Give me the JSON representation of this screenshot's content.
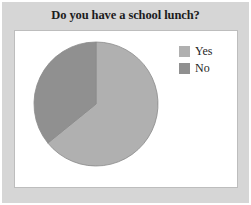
{
  "chart_data": {
    "type": "pie",
    "title": "Do you have a school lunch?",
    "xlabel": "",
    "ylabel": "",
    "categories": [
      "Yes",
      "No"
    ],
    "values": [
      64,
      36
    ],
    "units": "percent",
    "start_angle_deg": 0,
    "direction": "clockwise",
    "legend_position": "top-right",
    "grid": false,
    "slices": [
      {
        "label": "Yes",
        "value": 64,
        "sweep_deg": 231,
        "color": "#b0b0b0"
      },
      {
        "label": "No",
        "value": 36,
        "sweep_deg": 129,
        "color": "#909090"
      }
    ]
  },
  "legend": {
    "items": [
      {
        "label": "Yes",
        "color": "#b0b0b0"
      },
      {
        "label": "No",
        "color": "#909090"
      }
    ]
  },
  "colors": {
    "frame_background": "#d6d6d6",
    "plot_background": "#ffffff",
    "plot_border": "#bdbdbd",
    "title_text": "#1c1c1c",
    "slice_yes": "#b0b0b0",
    "slice_no": "#909090",
    "slice_outline": "#8a8a8a"
  },
  "geometry": {
    "center_x": 96,
    "center_y": 104,
    "radius": 62
  }
}
